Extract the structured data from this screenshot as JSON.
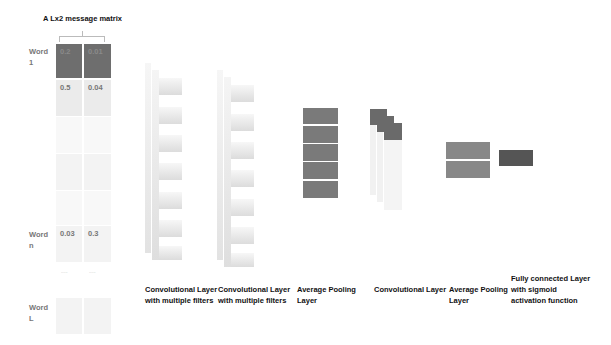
{
  "matrix": {
    "title": "A Lx2 message matrix",
    "rows": [
      {
        "label_line1": "Word",
        "label_line2": "1",
        "values": [
          "0.2",
          "0.01"
        ]
      },
      {
        "label_line1": "",
        "label_line2": "",
        "values": [
          "0.5",
          "0.04"
        ]
      },
      {
        "label_line1": "Word",
        "label_line2": "n",
        "values": [
          "0.03",
          "0.3"
        ]
      },
      {
        "label_line1": "Word",
        "label_line2": "L",
        "values": [
          "",
          ""
        ]
      }
    ],
    "ellipsis": [
      "......",
      "......"
    ]
  },
  "layers": [
    {
      "id": "conv1",
      "caption_line1": "Convolutional Layer",
      "caption_line2": "with multiple filters"
    },
    {
      "id": "conv2",
      "caption_line1": "Convolutional Layer",
      "caption_line2": "with multiple filters"
    },
    {
      "id": "pool1",
      "caption_line1": "Average Pooling",
      "caption_line2": "Layer"
    },
    {
      "id": "conv3",
      "caption_line1": "Convolutional Layer",
      "caption_line2": ""
    },
    {
      "id": "pool2",
      "caption_line1": "Average Pooling",
      "caption_line2": "Layer"
    },
    {
      "id": "fc",
      "caption_line1": "Fully connected Layer",
      "caption_line2": "with sigmoid",
      "caption_line3": "activation function"
    }
  ],
  "colors": {
    "dark_cell": "#6e6e6e",
    "pool_block": "#7a7a7a",
    "fc_block": "#555555"
  }
}
